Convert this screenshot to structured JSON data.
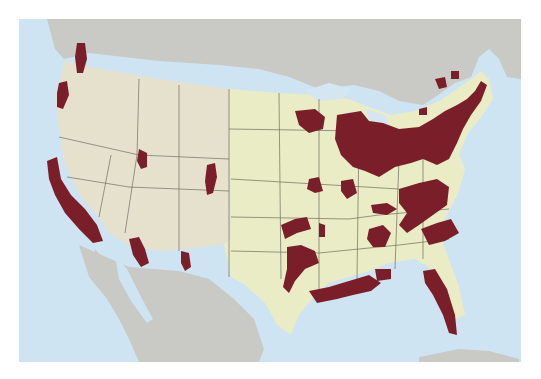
{
  "map": {
    "subject": "Contiguous United States with shaded regions",
    "colors": {
      "ocean": "#cfe4f2",
      "foreign_land": "#c9c9c6",
      "west_terrain": "#e6e1cd",
      "east_land": "#e9ecc4",
      "highlight_regions": "#7a1f2a",
      "borders": "#6f6f62",
      "lakes": "#d3e6f1"
    },
    "highlighted_regions": [
      "Puget Sound (WA)",
      "Willamette Valley (OR)",
      "California coast & Central Valley",
      "Salt Lake City (UT)",
      "Denver Front Range (CO)",
      "Phoenix (AZ)",
      "El Paso (TX)",
      "Minneapolis-St. Paul (MN)",
      "Kansas City",
      "Oklahoma",
      "Dallas-Fort Worth (TX)",
      "Houston / Gulf Coast (TX-LA)",
      "Great Lakes / Midwest industrial belt",
      "Northeast corridor",
      "Appalachian / Carolinas",
      "Florida peninsula"
    ]
  }
}
